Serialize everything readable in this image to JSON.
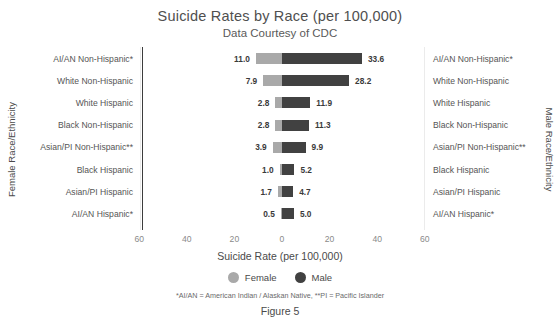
{
  "chart_data": {
    "type": "bar",
    "title": "Suicide Rates by Race (per 100,000)",
    "subtitle": "Data Courtesy of CDC",
    "xlabel": "Suicide Rate (per 100,000)",
    "ylabel_left": "Female Race/Ethnicity",
    "ylabel_right": "Male Race/Ethnicity",
    "orientation": "horizontal-diverging",
    "grid": false,
    "legend_position": "bottom",
    "xlim": [
      -60,
      60
    ],
    "xticks": [
      "60",
      "40",
      "20",
      "0",
      "20",
      "40",
      "60"
    ],
    "xtick_values": [
      -60,
      -40,
      -20,
      0,
      20,
      40,
      60
    ],
    "categories": [
      "AI/AN Non-Hispanic*",
      "White Non-Hispanic",
      "White Hispanic",
      "Black Non-Hispanic",
      "Asian/PI Non-Hispanic**",
      "Black Hispanic",
      "Asian/PI Hispanic",
      "AI/AN Hispanic*"
    ],
    "series": [
      {
        "name": "Female",
        "color": "#a9a9a9",
        "direction": "left",
        "values": [
          11.0,
          7.9,
          2.8,
          2.8,
          3.9,
          1.0,
          1.7,
          0.5
        ],
        "labels": [
          "11.0",
          "7.9",
          "2.8",
          "2.8",
          "3.9",
          "1.0",
          "1.7",
          "0.5"
        ]
      },
      {
        "name": "Male",
        "color": "#414141",
        "direction": "right",
        "values": [
          33.6,
          28.2,
          11.9,
          11.3,
          9.9,
          5.2,
          4.7,
          5.0
        ],
        "labels": [
          "33.6",
          "28.2",
          "11.9",
          "11.3",
          "9.9",
          "5.2",
          "4.7",
          "5.0"
        ]
      }
    ],
    "annotations": {
      "footnote": "*AI/AN = American Indian / Alaskan Native, **PI = Pacific Islander",
      "figure_caption": "Figure 5"
    }
  },
  "legend": {
    "female_label": "Female",
    "male_label": "Male"
  }
}
